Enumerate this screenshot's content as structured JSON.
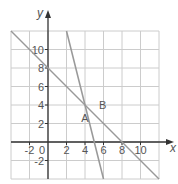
{
  "chart_data": {
    "type": "line",
    "title": "",
    "xlabel": "x",
    "ylabel": "y",
    "xlim": [
      -4,
      12
    ],
    "ylim": [
      -4,
      12
    ],
    "grid": true,
    "grid_step": 2,
    "x_ticks": [
      {
        "value": -2,
        "label": "-2"
      },
      {
        "value": 0,
        "label": "0"
      },
      {
        "value": 2,
        "label": "2"
      },
      {
        "value": 4,
        "label": "4"
      },
      {
        "value": 6,
        "label": "6"
      },
      {
        "value": 8,
        "label": "8"
      },
      {
        "value": 10,
        "label": "10"
      }
    ],
    "y_ticks": [
      {
        "value": -2,
        "label": "-2"
      },
      {
        "value": 2,
        "label": "2"
      },
      {
        "value": 4,
        "label": "4"
      },
      {
        "value": 6,
        "label": "6"
      },
      {
        "value": 8,
        "label": "8"
      },
      {
        "value": 10,
        "label": "10"
      }
    ],
    "series": [
      {
        "name": "A",
        "equation": "y = -2x + 8",
        "points": [
          [
            2,
            12
          ],
          [
            6,
            -4
          ]
        ],
        "label_pos": [
          3.6,
          2.2
        ]
      },
      {
        "name": "B",
        "equation": "y = -x + 8",
        "points": [
          [
            -4,
            12
          ],
          [
            12,
            -4
          ]
        ],
        "label_pos": [
          5.5,
          3.6
        ]
      }
    ],
    "legend": "none (inline labels A, B)",
    "colors": {
      "grid": "#cccccc",
      "axis": "#333333",
      "line": "#999999",
      "text": "#555555"
    }
  }
}
